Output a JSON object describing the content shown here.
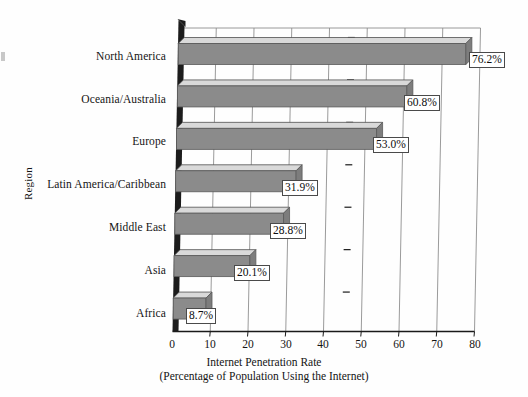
{
  "chart_data": {
    "type": "bar",
    "orientation": "horizontal",
    "style": "3d-perspective-scan",
    "title": "",
    "xlabel": "Internet Penetration Rate",
    "xlabel_line2": "(Percentage of Population Using the Internet)",
    "ylabel": "Region",
    "categories": [
      "North America",
      "Oceania/Australia",
      "Europe",
      "Latin America/Caribbean",
      "Middle East",
      "Asia",
      "Africa"
    ],
    "values": [
      76.2,
      60.8,
      53.0,
      31.9,
      28.8,
      20.1,
      8.7
    ],
    "value_labels": [
      "76.2%",
      "60.8%",
      "53.0%",
      "31.9%",
      "28.8%",
      "20.1%",
      "8.7%"
    ],
    "xticks": [
      0,
      10,
      20,
      30,
      40,
      50,
      60,
      70,
      80
    ],
    "xtick_labels": [
      "0",
      "10",
      "20",
      "30",
      "40",
      "50",
      "60",
      "70",
      "80"
    ],
    "xlim": [
      0,
      80
    ],
    "grid": true,
    "grid_axis": "x",
    "legend": null,
    "bar_color": "#8b8b8b",
    "bar_top_color": "#d9d9d9",
    "axis_color": "#1a1a1a",
    "grid_color": "#8f8f8f",
    "label_box_color": "#ffffff",
    "background": "#fefefe"
  },
  "axes": {
    "y_title": "Region",
    "x_title_line1": "Internet Penetration Rate",
    "x_title_line2": "(Percentage of Population Using the Internet)"
  }
}
